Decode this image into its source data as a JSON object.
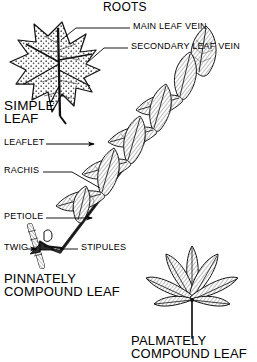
{
  "diagram": {
    "title": "ROOTS",
    "background_color": "#ffffff",
    "ink_color": "#000000"
  },
  "callouts": [
    {
      "id": "main-leaf-vein",
      "label": "MAIN LEAF VEIN"
    },
    {
      "id": "secondary-leaf-vein",
      "label": "SECONDARY LEAF VEIN"
    },
    {
      "id": "leaflet",
      "label": "LEAFLET"
    },
    {
      "id": "rachis",
      "label": "RACHIS"
    },
    {
      "id": "petiole",
      "label": "PETIOLE"
    },
    {
      "id": "twig",
      "label": "TWIG"
    },
    {
      "id": "stipules",
      "label": "STIPULES"
    }
  ],
  "specimens": [
    {
      "id": "simple-leaf",
      "label_line1": "SIMPLE",
      "label_line2": "LEAF"
    },
    {
      "id": "pinnately-compound-leaf",
      "label_line1": "PINNATELY",
      "label_line2": "COMPOUND LEAF"
    },
    {
      "id": "palmately-compound-leaf",
      "label_line1": "PALMATELY",
      "label_line2": "COMPOUND LEAF"
    }
  ]
}
